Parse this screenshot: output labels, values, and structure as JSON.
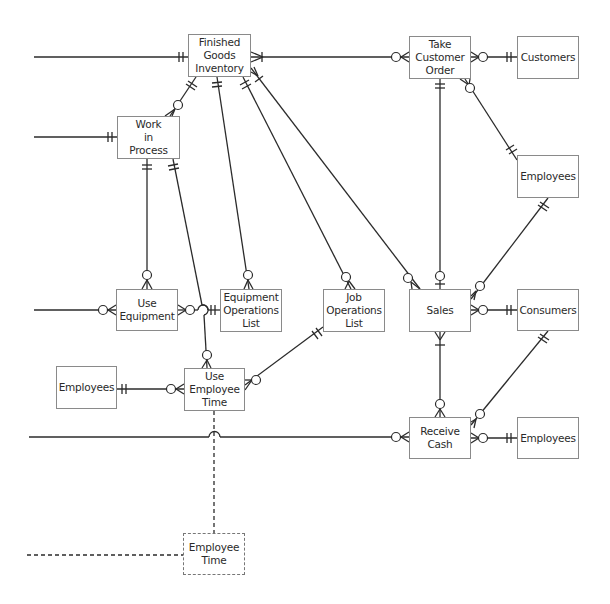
{
  "diagram": {
    "type": "REA entity-relationship diagram (crow's foot notation)",
    "entities": [
      {
        "id": "finished_goods_inventory",
        "label": "Finished\nGoods\nInventory",
        "x": 188,
        "y": 34,
        "w": 63,
        "h": 43
      },
      {
        "id": "work_in_process",
        "label": "Work\nin\nProcess",
        "x": 117,
        "y": 116,
        "w": 63,
        "h": 43
      },
      {
        "id": "take_customer_order",
        "label": "Take\nCustomer\nOrder",
        "x": 409,
        "y": 36,
        "w": 62,
        "h": 43
      },
      {
        "id": "customers",
        "label": "Customers",
        "x": 517,
        "y": 36,
        "w": 62,
        "h": 43
      },
      {
        "id": "employees_sales",
        "label": "Employees",
        "x": 517,
        "y": 155,
        "w": 62,
        "h": 43
      },
      {
        "id": "use_equipment",
        "label": "Use\nEquipment",
        "x": 116,
        "y": 289,
        "w": 62,
        "h": 42
      },
      {
        "id": "equipment_operations_list",
        "label": "Equipment\nOperations\nList",
        "x": 220,
        "y": 289,
        "w": 62,
        "h": 43
      },
      {
        "id": "job_operations_list",
        "label": "Job\nOperations\nList",
        "x": 323,
        "y": 289,
        "w": 62,
        "h": 43
      },
      {
        "id": "sales",
        "label": "Sales",
        "x": 409,
        "y": 289,
        "w": 62,
        "h": 43
      },
      {
        "id": "consumers",
        "label": "Consumers",
        "x": 517,
        "y": 289,
        "w": 62,
        "h": 42
      },
      {
        "id": "employees_production",
        "label": "Employees",
        "x": 56,
        "y": 366,
        "w": 61,
        "h": 43
      },
      {
        "id": "use_employee_time",
        "label": "Use\nEmployee\nTime",
        "x": 184,
        "y": 368,
        "w": 61,
        "h": 43
      },
      {
        "id": "receive_cash",
        "label": "Receive\nCash",
        "x": 409,
        "y": 417,
        "w": 62,
        "h": 42
      },
      {
        "id": "employees_cash",
        "label": "Employees",
        "x": 517,
        "y": 417,
        "w": 62,
        "h": 42
      },
      {
        "id": "employee_time",
        "label": "Employee\nTime",
        "x": 183,
        "y": 533,
        "w": 62,
        "h": 42,
        "style": "dashed"
      }
    ],
    "relationships": [
      {
        "from": "offpage_left",
        "to": "finished_goods_inventory",
        "to_card": "one-and-only-one"
      },
      {
        "from": "finished_goods_inventory",
        "to": "take_customer_order",
        "from_card": "many",
        "to_card": "zero-or-many"
      },
      {
        "from": "take_customer_order",
        "to": "customers",
        "from_card": "zero-or-many",
        "to_card": "one-and-only-one"
      },
      {
        "from": "take_customer_order",
        "to": "employees_sales",
        "from_card": "zero-or-many",
        "to_card": "one-and-only-one"
      },
      {
        "from": "take_customer_order",
        "to": "sales",
        "from_card": "one-and-only-one",
        "to_card": "zero-or-one"
      },
      {
        "from": "finished_goods_inventory",
        "to": "work_in_process",
        "from_card": "one-and-only-one",
        "to_card": "zero-or-many"
      },
      {
        "from": "offpage_left",
        "to": "work_in_process",
        "to_card": "one-and-only-one"
      },
      {
        "from": "work_in_process",
        "to": "use_equipment",
        "from_card": "one-and-only-one",
        "to_card": "zero-or-many"
      },
      {
        "from": "work_in_process",
        "to": "use_employee_time",
        "from_card": "one-and-only-one",
        "to_card": "zero-or-many"
      },
      {
        "from": "finished_goods_inventory",
        "to": "equipment_operations_list",
        "from_card": "one-and-only-one",
        "to_card": "zero-or-many"
      },
      {
        "from": "finished_goods_inventory",
        "to": "job_operations_list",
        "from_card": "one-and-only-one",
        "to_card": "zero-or-many"
      },
      {
        "from": "finished_goods_inventory",
        "to": "sales",
        "from_card": "one",
        "to_card": "zero-or-many"
      },
      {
        "from": "offpage_left",
        "to": "use_equipment",
        "to_card": "zero-or-many"
      },
      {
        "from": "use_equipment",
        "to": "equipment_operations_list",
        "from_card": "zero-or-many",
        "to_card": "one-and-only-one"
      },
      {
        "from": "employees_production",
        "to": "use_employee_time",
        "from_card": "one-and-only-one",
        "to_card": "zero-or-many"
      },
      {
        "from": "use_employee_time",
        "to": "job_operations_list",
        "from_card": "zero-or-many",
        "to_card": "one-and-only-one"
      },
      {
        "from": "employees_sales",
        "to": "sales",
        "from_card": "one-and-only-one",
        "to_card": "zero-or-many"
      },
      {
        "from": "sales",
        "to": "consumers",
        "from_card": "zero-or-many",
        "to_card": "one-and-only-one"
      },
      {
        "from": "sales",
        "to": "receive_cash",
        "from_card": "one-or-many",
        "to_card": "zero-or-many"
      },
      {
        "from": "consumers",
        "to": "receive_cash",
        "from_card": "one-and-only-one",
        "to_card": "zero-or-many"
      },
      {
        "from": "offpage_left",
        "to": "receive_cash",
        "to_card": "zero-or-many"
      },
      {
        "from": "receive_cash",
        "to": "employees_cash",
        "from_card": "zero-or-many",
        "to_card": "one-and-only-one"
      },
      {
        "from": "use_employee_time",
        "to": "employee_time",
        "style": "dashed"
      },
      {
        "from": "offpage_left",
        "to": "employee_time",
        "style": "dashed"
      }
    ]
  }
}
